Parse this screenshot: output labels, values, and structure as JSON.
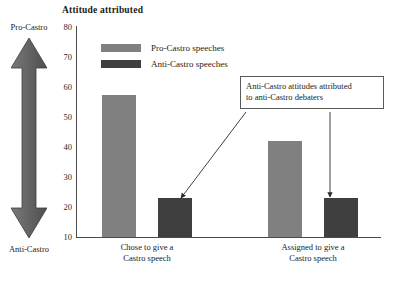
{
  "chart_data": {
    "type": "bar",
    "title": "Attitude attributed",
    "xlabel": "",
    "ylabel": "Attitude attributed",
    "ylim": [
      10,
      80
    ],
    "ytick_labels": [
      "80",
      "70",
      "60",
      "50",
      "40",
      "30",
      "20",
      "10"
    ],
    "yticks": [
      80,
      70,
      60,
      50,
      40,
      30,
      20,
      10
    ],
    "grid": false,
    "legend_position": "upper-left-inside",
    "categories": [
      "Chose to give a Castro speech",
      "Assigned to give a Castro speech"
    ],
    "series": [
      {
        "name": "Pro-Castro speeches",
        "values": [
          57,
          42
        ],
        "color": "#808080"
      },
      {
        "name": "Anti-Castro speeches",
        "values": [
          23,
          23
        ],
        "color": "#3f3f3f"
      }
    ],
    "annotations": [
      {
        "text_line1": "Anti-Castro attitudes attributed",
        "text_line2": "to anti-Castro debaters",
        "points_to": [
          "Anti-Castro speeches / Chose to give a Castro speech",
          "Anti-Castro speeches / Assigned to give a Castro speech"
        ]
      }
    ],
    "axis_scale_arrow": {
      "top_label": "Pro-Castro",
      "bottom_label": "Anti-Castro"
    }
  },
  "title": {
    "text": "Attitude attributed"
  },
  "attitude_scale": {
    "top_label": "Pro-Castro",
    "bottom_label": "Anti-Castro"
  },
  "y_axis": {
    "ticks": [
      {
        "label": "80",
        "value": 80
      },
      {
        "label": "70",
        "value": 70
      },
      {
        "label": "60",
        "value": 60
      },
      {
        "label": "50",
        "value": 50
      },
      {
        "label": "40",
        "value": 40
      },
      {
        "label": "30",
        "value": 30
      },
      {
        "label": "20",
        "value": 20
      },
      {
        "label": "10",
        "value": 10
      }
    ]
  },
  "legend": {
    "items": [
      {
        "label": "Pro-Castro speeches",
        "color": "#808080"
      },
      {
        "label": "Anti-Castro speeches",
        "color": "#3f3f3f"
      }
    ]
  },
  "groups": [
    {
      "line1": "Chose to give a",
      "line2": "Castro speech"
    },
    {
      "line1": "Assigned to give a",
      "line2": "Castro speech"
    }
  ],
  "bars": [
    {
      "name": "chose-pro-castro",
      "value": 57,
      "series": "Pro-Castro speeches"
    },
    {
      "name": "chose-anti-castro",
      "value": 23,
      "series": "Anti-Castro speeches"
    },
    {
      "name": "assigned-pro-castro",
      "value": 42,
      "series": "Pro-Castro speeches"
    },
    {
      "name": "assigned-anti-castro",
      "value": 23,
      "series": "Anti-Castro speeches"
    }
  ],
  "callout": {
    "line1": "Anti-Castro attitudes attributed",
    "line2": "to anti-Castro debaters"
  }
}
